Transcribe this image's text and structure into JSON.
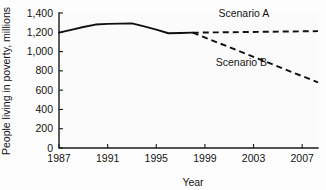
{
  "chart_data": {
    "type": "line",
    "title": "",
    "xlabel": "Year",
    "ylabel": "People living in poverty, millions",
    "xlim": [
      1987,
      2008.3
    ],
    "ylim": [
      0,
      1400
    ],
    "grid": false,
    "legend_position": "inline-annotation",
    "x_ticks": [
      "1987",
      "1991",
      "1995",
      "1999",
      "2003",
      "2007"
    ],
    "x_tick_values": [
      1987,
      1991,
      1995,
      1999,
      2003,
      2007
    ],
    "y_ticks": [
      "0",
      "200",
      "400",
      "600",
      "800",
      "1,000",
      "1,200",
      "1,400"
    ],
    "y_tick_values": [
      0,
      200,
      400,
      600,
      800,
      1000,
      1200,
      1400
    ],
    "series": [
      {
        "name": "Historical",
        "style": "solid",
        "x": [
          1987,
          1988,
          1989,
          1990,
          1991,
          1992,
          1993,
          1994,
          1995,
          1996,
          1997,
          1998
        ],
        "values": [
          1196,
          1225,
          1255,
          1280,
          1287,
          1290,
          1292,
          1262,
          1228,
          1190,
          1192,
          1196
        ]
      },
      {
        "name": "Scenario A",
        "style": "dashed",
        "x": [
          1998,
          2008.3
        ],
        "values": [
          1196,
          1212
        ]
      },
      {
        "name": "Scenario B",
        "style": "dashed",
        "x": [
          1998,
          2008.3
        ],
        "values": [
          1196,
          680
        ]
      }
    ],
    "annotations": [
      {
        "text": "Scenario A",
        "x": 2002.2,
        "y": 1355
      },
      {
        "text": "Scenario B",
        "x": 2002.0,
        "y": 855
      }
    ]
  }
}
